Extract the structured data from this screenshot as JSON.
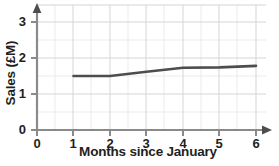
{
  "chart_data": {
    "type": "line",
    "title": "",
    "xlabel": "Months since January",
    "ylabel": "Sales (£M)",
    "x": [
      1,
      2,
      3,
      4,
      5,
      6
    ],
    "values": [
      1.5,
      1.5,
      1.62,
      1.73,
      1.74,
      1.78
    ],
    "series": [
      {
        "name": "Sales",
        "values": [
          1.5,
          1.5,
          1.62,
          1.73,
          1.74,
          1.78
        ]
      }
    ],
    "xlim": [
      0,
      6
    ],
    "ylim": [
      0,
      3
    ],
    "xticks": [
      "0",
      "1",
      "2",
      "3",
      "4",
      "5",
      "6"
    ],
    "yticks": [
      "0",
      "1",
      "2",
      "3"
    ],
    "grid": true,
    "minor_grid_step": 0.5,
    "legend": "none",
    "line_color": "#4d4d4d",
    "grid_color": "#d9d9d9",
    "minor_grid_color": "#ebebeb",
    "axis_color": "#808080"
  },
  "axes": {
    "y_title": "Sales (£M)",
    "x_title": "Months since January",
    "y_tick_labels": [
      "3",
      "2",
      "1",
      "0"
    ],
    "x_tick_labels": [
      "0",
      "1",
      "2",
      "3",
      "4",
      "5",
      "6"
    ]
  }
}
